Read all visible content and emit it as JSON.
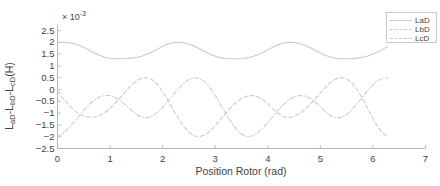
{
  "chart_data": {
    "type": "line",
    "title": "",
    "xlabel": "Position Rotor (rad)",
    "ylabel": "L_aD-L_bD-L_cD(H)",
    "ylabel_parts": {
      "p1": "L",
      "s1": "aD",
      "d1": "-",
      "p2": "L",
      "s2": "bD",
      "d2": "-",
      "p3": "L",
      "s3": "cD",
      "unit": "(H)"
    },
    "y_exponent_label": "× 10",
    "y_exponent_power": "-3",
    "y_scale": 0.001,
    "xlim": [
      0,
      7
    ],
    "ylim": [
      -2.5,
      2.5
    ],
    "xticks": [
      "0",
      "1",
      "2",
      "3",
      "4",
      "5",
      "6",
      "7"
    ],
    "xtick_values": [
      0,
      1,
      2,
      3,
      4,
      5,
      6,
      7
    ],
    "yticks": [
      "2.5",
      "2",
      "1.5",
      "1",
      "0.5",
      "0",
      "-0.5",
      "-1",
      "-1.5",
      "-2",
      "-2.5"
    ],
    "ytick_values": [
      2.5,
      2,
      1.5,
      1,
      0.5,
      0,
      -0.5,
      -1,
      -1.5,
      -2,
      -2.5
    ],
    "grid": false,
    "legend_position": "top-right",
    "line_color": "#c9c9c9",
    "axis_color": "#b0b0b0",
    "text_color": "#3f3f3f",
    "series": [
      {
        "name": "LaD",
        "style": "solid",
        "period": 2.094,
        "offset": 1.65,
        "amplitude": 0.35,
        "phase": 0.0,
        "values_note": "flat-topped cosine oscillating between about 1.3 and 2.0 (x10^-3)",
        "x": [
          0.0,
          0.1,
          0.2,
          0.3,
          0.4,
          0.5,
          0.6,
          0.7,
          0.8,
          0.9,
          1.0,
          1.1,
          1.2,
          1.3,
          1.4,
          1.5,
          1.6,
          1.7,
          1.8,
          1.9,
          2.0,
          2.1,
          2.2,
          2.3,
          2.4,
          2.5,
          2.6,
          2.7,
          2.8,
          2.9,
          3.0,
          3.1,
          3.2,
          3.3,
          3.4,
          3.5,
          3.6,
          3.7,
          3.8,
          3.9,
          4.0,
          4.1,
          4.2,
          4.3,
          4.4,
          4.5,
          4.6,
          4.7,
          4.8,
          4.9,
          5.0,
          5.1,
          5.2,
          5.3,
          5.4,
          5.5,
          5.6,
          5.7,
          5.8,
          5.9,
          6.0,
          6.1,
          6.2,
          6.28
        ],
        "y": [
          1.97,
          2.0,
          1.99,
          1.95,
          1.88,
          1.78,
          1.67,
          1.55,
          1.45,
          1.37,
          1.32,
          1.3,
          1.3,
          1.31,
          1.33,
          1.36,
          1.41,
          1.49,
          1.59,
          1.71,
          1.83,
          1.93,
          1.99,
          2.0,
          1.98,
          1.93,
          1.84,
          1.73,
          1.61,
          1.5,
          1.41,
          1.35,
          1.31,
          1.3,
          1.3,
          1.31,
          1.34,
          1.39,
          1.46,
          1.56,
          1.68,
          1.8,
          1.9,
          1.97,
          2.0,
          1.99,
          1.95,
          1.88,
          1.78,
          1.66,
          1.55,
          1.44,
          1.37,
          1.32,
          1.3,
          1.3,
          1.31,
          1.33,
          1.37,
          1.42,
          1.5,
          1.6,
          1.72,
          1.82
        ]
      },
      {
        "name": "LbD",
        "style": "dashed",
        "period": 2.094,
        "values_note": "dashed wave from about -2.0 up to about +0.5 (x10^-3)",
        "x": [
          0.0,
          0.1,
          0.2,
          0.3,
          0.4,
          0.5,
          0.6,
          0.7,
          0.8,
          0.9,
          1.0,
          1.1,
          1.2,
          1.3,
          1.4,
          1.5,
          1.6,
          1.7,
          1.8,
          1.9,
          2.0,
          2.1,
          2.2,
          2.3,
          2.4,
          2.5,
          2.6,
          2.7,
          2.8,
          2.9,
          3.0,
          3.1,
          3.2,
          3.3,
          3.4,
          3.5,
          3.6,
          3.7,
          3.8,
          3.9,
          4.0,
          4.1,
          4.2,
          4.3,
          4.4,
          4.5,
          4.6,
          4.7,
          4.8,
          4.9,
          5.0,
          5.1,
          5.2,
          5.3,
          5.4,
          5.5,
          5.6,
          5.7,
          5.8,
          5.9,
          6.0,
          6.1,
          6.2,
          6.28
        ],
        "y": [
          -0.05,
          -0.35,
          -0.62,
          -0.85,
          -1.02,
          -1.13,
          -1.18,
          -1.17,
          -1.1,
          -0.98,
          -0.8,
          -0.58,
          -0.33,
          -0.07,
          0.17,
          0.36,
          0.48,
          0.5,
          0.42,
          0.22,
          -0.08,
          -0.45,
          -0.85,
          -1.22,
          -1.56,
          -1.81,
          -1.96,
          -2.0,
          -1.93,
          -1.77,
          -1.54,
          -1.27,
          -1.0,
          -0.75,
          -0.54,
          -0.38,
          -0.28,
          -0.25,
          -0.3,
          -0.42,
          -0.6,
          -0.82,
          -1.02,
          -1.15,
          -1.19,
          -1.15,
          -1.03,
          -0.86,
          -0.64,
          -0.4,
          -0.15,
          0.1,
          0.31,
          0.45,
          0.5,
          0.45,
          0.28,
          0.0,
          -0.38,
          -0.8,
          -1.23,
          -1.6,
          -1.87,
          -2.0
        ]
      },
      {
        "name": "LcD",
        "style": "dashdot",
        "period": 2.094,
        "values_note": "dash-dot wave, phase shifted from LbD, from about -2.0 up to about +0.5 (x10^-3)",
        "x": [
          0.0,
          0.1,
          0.2,
          0.3,
          0.4,
          0.5,
          0.6,
          0.7,
          0.8,
          0.9,
          1.0,
          1.1,
          1.2,
          1.3,
          1.4,
          1.5,
          1.6,
          1.7,
          1.8,
          1.9,
          2.0,
          2.1,
          2.2,
          2.3,
          2.4,
          2.5,
          2.6,
          2.7,
          2.8,
          2.9,
          3.0,
          3.1,
          3.2,
          3.3,
          3.4,
          3.5,
          3.6,
          3.7,
          3.8,
          3.9,
          4.0,
          4.1,
          4.2,
          4.3,
          4.4,
          4.5,
          4.6,
          4.7,
          4.8,
          4.9,
          5.0,
          5.1,
          5.2,
          5.3,
          5.4,
          5.5,
          5.6,
          5.7,
          5.8,
          5.9,
          6.0,
          6.1,
          6.2,
          6.28
        ],
        "y": [
          -2.0,
          -1.88,
          -1.68,
          -1.42,
          -1.15,
          -0.88,
          -0.64,
          -0.45,
          -0.31,
          -0.25,
          -0.26,
          -0.34,
          -0.48,
          -0.66,
          -0.87,
          -1.05,
          -1.17,
          -1.2,
          -1.13,
          -0.98,
          -0.76,
          -0.5,
          -0.23,
          0.03,
          0.26,
          0.42,
          0.5,
          0.47,
          0.33,
          0.08,
          -0.25,
          -0.63,
          -1.02,
          -1.38,
          -1.68,
          -1.89,
          -1.99,
          -1.97,
          -1.85,
          -1.65,
          -1.4,
          -1.13,
          -0.87,
          -0.63,
          -0.44,
          -0.31,
          -0.25,
          -0.27,
          -0.37,
          -0.53,
          -0.73,
          -0.95,
          -1.12,
          -1.2,
          -1.18,
          -1.06,
          -0.86,
          -0.6,
          -0.32,
          -0.04,
          0.2,
          0.39,
          0.49,
          0.5
        ]
      }
    ]
  },
  "legend": {
    "items": [
      {
        "label": "LaD",
        "style": "solid"
      },
      {
        "label": "LbD",
        "style": "dashed"
      },
      {
        "label": "LcD",
        "style": "dashdot"
      }
    ]
  }
}
